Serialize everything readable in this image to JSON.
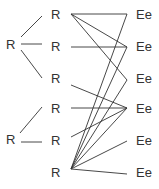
{
  "diagram": {
    "left_nodes": [
      {
        "id": "L1",
        "label": "R",
        "x": 6,
        "y": 38
      },
      {
        "id": "L2",
        "label": "R",
        "x": 6,
        "y": 133
      }
    ],
    "middle_nodes": [
      {
        "id": "M1",
        "label": "R",
        "x": 51,
        "y": 8
      },
      {
        "id": "M2",
        "label": "R",
        "x": 51,
        "y": 40
      },
      {
        "id": "M3",
        "label": "R",
        "x": 51,
        "y": 72
      },
      {
        "id": "M4",
        "label": "R",
        "x": 51,
        "y": 102
      },
      {
        "id": "M5",
        "label": "R",
        "x": 51,
        "y": 134
      },
      {
        "id": "M6",
        "label": "R",
        "x": 51,
        "y": 166
      }
    ],
    "right_nodes": [
      {
        "id": "E1",
        "label": "Ee",
        "x": 136,
        "y": 8
      },
      {
        "id": "E2",
        "label": "Ee",
        "x": 136,
        "y": 40
      },
      {
        "id": "E3",
        "label": "Ee",
        "x": 136,
        "y": 72
      },
      {
        "id": "E4",
        "label": "Ee",
        "x": 136,
        "y": 102
      },
      {
        "id": "E5",
        "label": "Ee",
        "x": 136,
        "y": 134
      },
      {
        "id": "E6",
        "label": "Ee",
        "x": 136,
        "y": 166
      }
    ],
    "edges": [
      {
        "from": "L1",
        "to": "M1",
        "x1": 21,
        "y1": 37,
        "x2": 42,
        "y2": 16
      },
      {
        "from": "L1",
        "to": "M2",
        "x1": 21,
        "y1": 44,
        "x2": 42,
        "y2": 44
      },
      {
        "from": "L1",
        "to": "M3",
        "x1": 21,
        "y1": 50,
        "x2": 42,
        "y2": 78
      },
      {
        "from": "L2",
        "to": "M4",
        "x1": 20,
        "y1": 133,
        "x2": 42,
        "y2": 107
      },
      {
        "from": "L2",
        "to": "M5",
        "x1": 21,
        "y1": 142,
        "x2": 42,
        "y2": 142
      },
      {
        "from": "M1",
        "to": "E1",
        "x1": 71,
        "y1": 14,
        "x2": 127,
        "y2": 14
      },
      {
        "from": "M1",
        "to": "E2",
        "x1": 71,
        "y1": 14,
        "x2": 127,
        "y2": 47
      },
      {
        "from": "M1",
        "to": "E3",
        "x1": 71,
        "y1": 14,
        "x2": 127,
        "y2": 80
      },
      {
        "from": "M2",
        "to": "E2",
        "x1": 71,
        "y1": 47,
        "x2": 127,
        "y2": 47
      },
      {
        "from": "M3",
        "to": "E4",
        "x1": 71,
        "y1": 85,
        "x2": 127,
        "y2": 108
      },
      {
        "from": "M4",
        "to": "E4",
        "x1": 71,
        "y1": 108,
        "x2": 127,
        "y2": 108
      },
      {
        "from": "M5",
        "to": "E4",
        "x1": 71,
        "y1": 137,
        "x2": 127,
        "y2": 108
      },
      {
        "from": "M6",
        "to": "E1",
        "x1": 71,
        "y1": 169,
        "x2": 127,
        "y2": 14
      },
      {
        "from": "M6",
        "to": "E2",
        "x1": 71,
        "y1": 169,
        "x2": 127,
        "y2": 47
      },
      {
        "from": "M6",
        "to": "E3",
        "x1": 71,
        "y1": 169,
        "x2": 127,
        "y2": 80
      },
      {
        "from": "M6",
        "to": "E4",
        "x1": 71,
        "y1": 169,
        "x2": 127,
        "y2": 108
      },
      {
        "from": "M6",
        "to": "E5",
        "x1": 71,
        "y1": 169,
        "x2": 127,
        "y2": 141
      },
      {
        "from": "M6",
        "to": "E6",
        "x1": 71,
        "y1": 169,
        "x2": 127,
        "y2": 174
      }
    ],
    "colors": {
      "line": "#333333",
      "text": "#333333",
      "background": "#ffffff"
    }
  }
}
